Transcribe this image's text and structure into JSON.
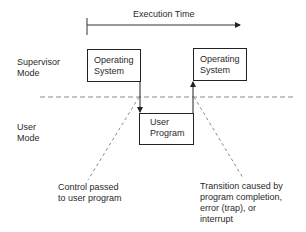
{
  "diagram": {
    "type": "mode-transition-timeline",
    "timeline": {
      "label": "Execution Time",
      "direction": "left-to-right"
    },
    "modes": {
      "supervisor": {
        "line1": "Supervisor",
        "line2": "Mode"
      },
      "user": {
        "line1": "User",
        "line2": "Mode"
      }
    },
    "boxes": {
      "os_first": {
        "line1": "Operating",
        "line2": "System",
        "mode": "Supervisor Mode"
      },
      "user_program": {
        "line1": "User",
        "line2": "Program",
        "mode": "User Mode"
      },
      "os_second": {
        "line1": "Operating",
        "line2": "System",
        "mode": "Supervisor Mode"
      }
    },
    "annotations": {
      "control_passed": {
        "line1": "Control passed",
        "line2": "to user program"
      },
      "transition": {
        "line1": "Transition caused by",
        "line2": "program completion,",
        "line3": "error (trap), or",
        "line4": "interrupt"
      }
    },
    "edges": [
      {
        "from": "Operating System",
        "to": "User Program",
        "label": "Control passed to user program"
      },
      {
        "from": "User Program",
        "to": "Operating System",
        "label": "Transition caused by program completion, error (trap), or interrupt"
      }
    ],
    "colors": {
      "ink": "#222222",
      "dashed": "#8a8a8a",
      "background": "#ffffff"
    }
  }
}
